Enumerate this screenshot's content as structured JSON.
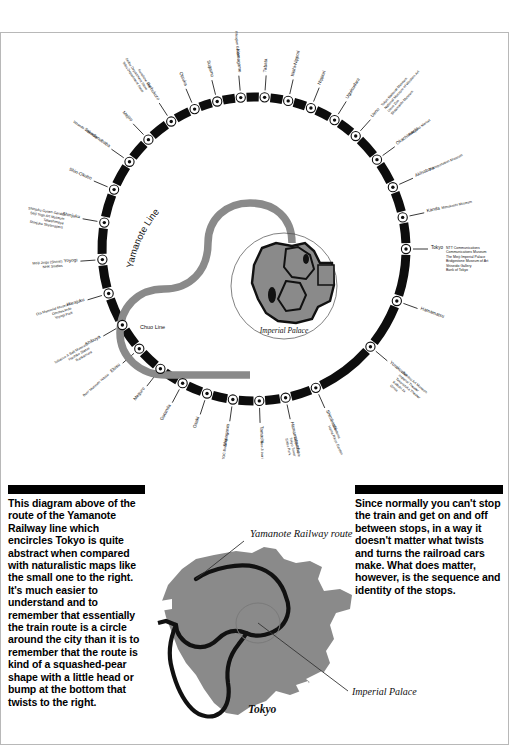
{
  "diagram": {
    "line_label": "Yamanote Line",
    "chuo_label": "Chuo Line",
    "center_label": "Imperial Palace",
    "stations": [
      {
        "name": "Tokyo",
        "angle": 90,
        "notes": [
          "NTT Communications",
          "Communications Museum",
          "The Meiji Imperial Palace",
          "Bridgestone Museum of Art",
          "Shiseido Gallery",
          "Bank of Tokyo"
        ]
      },
      {
        "name": "Kanda",
        "angle": 78,
        "notes": [
          "Mitsukoshi Museum"
        ]
      },
      {
        "name": "Akihabara",
        "angle": 66,
        "notes": [
          "Transportation Museum"
        ]
      },
      {
        "name": "Okachimachi",
        "angle": 54,
        "notes": [
          "Ameyoko Market"
        ]
      },
      {
        "name": "Ueno",
        "angle": 42,
        "notes": [
          "Tokyo National Museum",
          "National Museum of Western Art",
          "Ueno Zoo",
          "Shitamachi Museum"
        ]
      },
      {
        "name": "Uguisudani",
        "angle": 32,
        "notes": []
      },
      {
        "name": "Nippori",
        "angle": 22,
        "notes": []
      },
      {
        "name": "Nishi-Nippori",
        "angle": 13,
        "notes": []
      },
      {
        "name": "Tabata",
        "angle": 4,
        "notes": []
      },
      {
        "name": "Komagome",
        "angle": -5,
        "notes": [
          "Rikugien Garden"
        ]
      },
      {
        "name": "Sugamo",
        "angle": -14,
        "notes": []
      },
      {
        "name": "Otsuka",
        "angle": -23,
        "notes": []
      },
      {
        "name": "Ikebukuro",
        "angle": -33,
        "notes": [
          "Sunshine City",
          "Seibu Department Store",
          "Tobu Department Store"
        ]
      },
      {
        "name": "Mejiro",
        "angle": -44,
        "notes": []
      },
      {
        "name": "Takadanobaba",
        "angle": -55,
        "notes": [
          "Waseda University"
        ]
      },
      {
        "name": "Shin-Okubo",
        "angle": -67,
        "notes": []
      },
      {
        "name": "Shinjuku",
        "angle": -80,
        "notes": [
          "Shinjuku Gyoen Garden",
          "Seiji Togo Art Museum",
          "Takashimaya",
          "Shinjuku Skyscrapers"
        ]
      },
      {
        "name": "Yoyogi",
        "angle": -94,
        "notes": [
          "Meiji Jingu (Shrine)",
          "NHK Studios"
        ]
      },
      {
        "name": "Harajuku",
        "angle": -107,
        "notes": [
          "Ota Memorial Museum",
          "Omotesando",
          "Yoyogi Park"
        ]
      },
      {
        "name": "Shibuya",
        "angle": -120,
        "notes": [
          "Tobacco & Salt Museum",
          "Hachiko Statue",
          "Bunkamura"
        ]
      },
      {
        "name": "Ebisu",
        "angle": -131,
        "notes": [
          "Beer Museum Yebisu"
        ]
      },
      {
        "name": "Meguro",
        "angle": -142,
        "notes": []
      },
      {
        "name": "Gotanda",
        "angle": -152,
        "notes": []
      },
      {
        "name": "Osaki",
        "angle": -162,
        "notes": []
      },
      {
        "name": "Shinagawa",
        "angle": -172,
        "notes": [
          "TOC Building"
        ]
      },
      {
        "name": "Tamachi",
        "angle": 178,
        "notes": [
          "Sen-Ji Inari"
        ]
      },
      {
        "name": "Hamamatsucho",
        "angle": 168,
        "notes": [
          "Zojoji Temple",
          "Tokyo Tower",
          "Shiba Park"
        ]
      },
      {
        "name": "Shimbashi",
        "angle": 156,
        "notes": [
          "Shiodome",
          "Hama Rikyu Garden"
        ]
      },
      {
        "name": "Yurakucho",
        "angle": 130,
        "notes": [
          "Idemitsu Art Museum",
          "Imperial Theater",
          "Takarazuka Theater",
          "Kabuki-za",
          "Ginza"
        ]
      },
      {
        "name": "Hamamatsu",
        "angle": 110,
        "notes": []
      }
    ]
  },
  "map": {
    "title_route": "Yamanote Railway route",
    "title_palace": "Imperial Palace",
    "city_label": "Tokyo"
  },
  "captions": {
    "left": "This diagram above of the route of the Yamanote Railway line which encircles Tokyo is quite abstract when compared with naturalistic maps like the small one to the right. It's much easier to understand and to remember that essentially the train route is a circle around the city than it is to remember that the route is kind of a squashed-pear shape with a little head or bump at the bottom that twists to the right.",
    "right": "Since normally you can't stop the train and get on and off between stops, in a way it doesn't matter what twists and turns the railroad cars make. What does matter, however, is the sequence and identity of the stops."
  },
  "colors": {
    "line_black": "#0d0d0d",
    "line_gray": "#8a8a8a",
    "map_fill": "#8a8a8a",
    "frame": "#b8b8b8"
  }
}
